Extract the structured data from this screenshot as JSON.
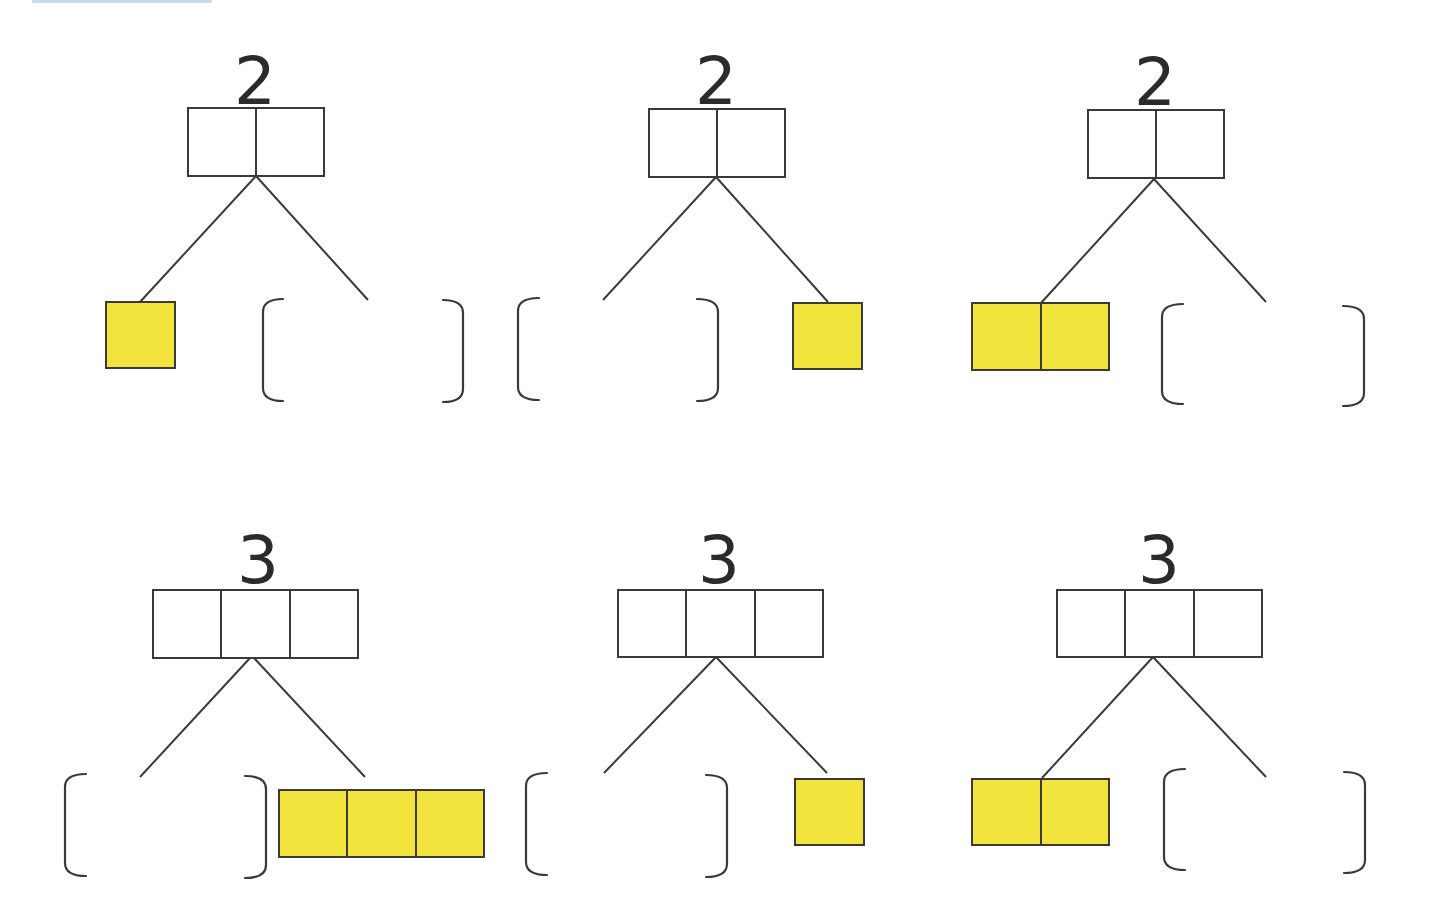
{
  "worksheet": {
    "topic": "number bonds",
    "problems": [
      {
        "id": 1,
        "total": "2",
        "total_cells": 2,
        "known_part_cells": 2,
        "known_side": "left",
        "known_count": 1,
        "answer_blank": "right"
      },
      {
        "id": 2,
        "total": "2",
        "total_cells": 2,
        "known_side": "right",
        "known_count": 1,
        "answer_blank": "left"
      },
      {
        "id": 3,
        "total": "2",
        "total_cells": 2,
        "known_side": "left",
        "known_count": 2,
        "answer_blank": "right"
      },
      {
        "id": 4,
        "total": "3",
        "total_cells": 3,
        "known_side": "right",
        "known_count": 3,
        "answer_blank": "left"
      },
      {
        "id": 5,
        "total": "3",
        "total_cells": 3,
        "known_side": "right",
        "known_count": 1,
        "answer_blank": "left"
      },
      {
        "id": 6,
        "total": "3",
        "total_cells": 3,
        "known_side": "left",
        "known_count": 2,
        "answer_blank": "right"
      }
    ],
    "colors": {
      "counter_fill": "#f2e43c",
      "line": "#3a3a3a",
      "background": "#ffffff"
    }
  }
}
